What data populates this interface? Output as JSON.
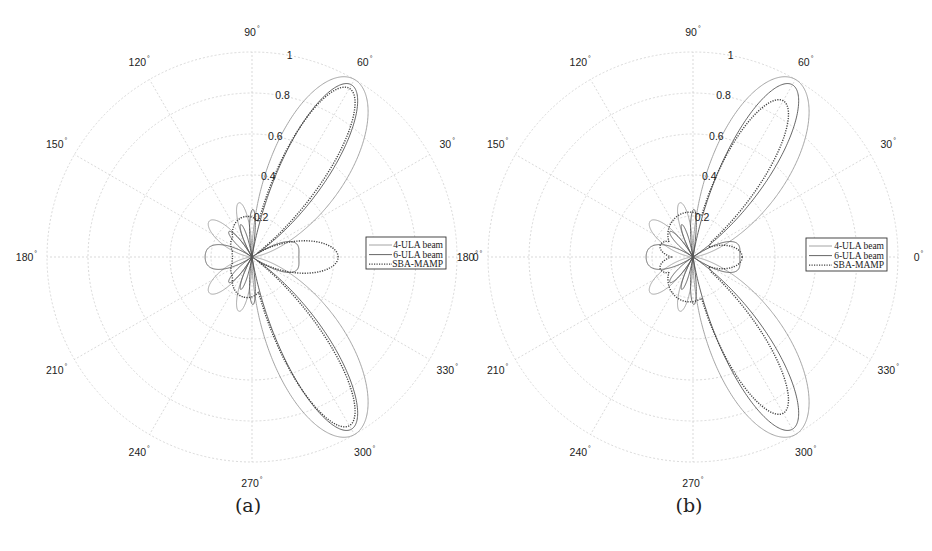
{
  "figure": {
    "panels": [
      {
        "id": "a",
        "caption": "(a)",
        "center": [
          252,
          257
        ],
        "radius": 205,
        "legend_box": [
          366,
          237,
          80,
          32
        ]
      },
      {
        "id": "b",
        "caption": "(b)",
        "center": [
          693,
          257
        ],
        "radius": 205,
        "legend_box": [
          806,
          238,
          81,
          33
        ]
      }
    ],
    "angle_labels": [
      "0",
      "30",
      "60",
      "90",
      "120",
      "150",
      "180",
      "210",
      "240",
      "270",
      "300",
      "330"
    ],
    "radial_labels": [
      "0.2",
      "0.4",
      "0.6",
      "0.8",
      "1"
    ],
    "degree_symbol": "°",
    "colors": {
      "grid": "#c8c8c8",
      "ula4": "#9a9a9a",
      "ula6": "#555555",
      "sba": "#444444",
      "text": "#222222",
      "legend_border": "#333333"
    }
  },
  "chart_data": [
    {
      "type": "polar",
      "title": "(a)",
      "rlim": [
        0,
        1
      ],
      "radial_ticks": [
        0.2,
        0.4,
        0.6,
        0.8,
        1
      ],
      "radial_tick_angle_deg": 80,
      "angle_ticks_deg": [
        0,
        30,
        60,
        90,
        120,
        150,
        180,
        210,
        240,
        270,
        300,
        330
      ],
      "grid": true,
      "legend": {
        "position": "right-of-center",
        "entries": [
          "4-ULA beam",
          "6-ULA beam",
          "SBA-MAMP"
        ]
      },
      "series": [
        {
          "name": "4-ULA beam",
          "style": "solid-light",
          "model": "ula",
          "N": 4,
          "steer_deg": 60,
          "scale": 1.0,
          "peaks": [
            {
              "angle": 60,
              "r": 1.0
            },
            {
              "angle": 300,
              "r": 1.0
            },
            {
              "angle": 104,
              "r": 0.27
            },
            {
              "angle": 139,
              "r": 0.27
            },
            {
              "angle": 180,
              "r": 0.22
            },
            {
              "angle": 0,
              "r": 0.21
            }
          ]
        },
        {
          "name": "6-ULA beam",
          "style": "solid-dark",
          "model": "ula",
          "N": 6,
          "steer_deg": 60,
          "scale": 0.97,
          "peaks": [
            {
              "angle": 60,
              "r": 0.97
            },
            {
              "angle": 300,
              "r": 0.97
            },
            {
              "angle": 95,
              "r": 0.21
            },
            {
              "angle": 115,
              "r": 0.17
            },
            {
              "angle": 135,
              "r": 0.15
            }
          ]
        },
        {
          "name": "SBA-MAMP",
          "style": "dotted",
          "model": "lobes",
          "lobes": [
            [
              60,
              0.95,
              9
            ],
            [
              300,
              0.95,
              9
            ],
            [
              0,
              0.42,
              14
            ],
            [
              100,
              0.2,
              30
            ],
            [
              260,
              0.2,
              30
            ],
            [
              120,
              0.14,
              40
            ],
            [
              240,
              0.14,
              40
            ],
            [
              160,
              0.1,
              40
            ],
            [
              200,
              0.1,
              40
            ]
          ],
          "peaks": [
            {
              "angle": 60,
              "r": 0.95
            },
            {
              "angle": 300,
              "r": 0.95
            },
            {
              "angle": 0,
              "r": 0.42
            }
          ]
        }
      ]
    },
    {
      "type": "polar",
      "title": "(b)",
      "rlim": [
        0,
        1
      ],
      "radial_ticks": [
        0.2,
        0.4,
        0.6,
        0.8,
        1
      ],
      "radial_tick_angle_deg": 80,
      "angle_ticks_deg": [
        0,
        30,
        60,
        90,
        120,
        150,
        180,
        210,
        240,
        270,
        300,
        330
      ],
      "grid": true,
      "legend": {
        "position": "right-of-center",
        "entries": [
          "4-ULA beam",
          "6-ULA beam",
          "SBA-MAMP"
        ]
      },
      "series": [
        {
          "name": "4-ULA beam",
          "style": "solid-light",
          "model": "ula",
          "N": 4,
          "steer_deg": 60,
          "scale": 1.0,
          "peaks": [
            {
              "angle": 60,
              "r": 1.0
            },
            {
              "angle": 300,
              "r": 1.0
            },
            {
              "angle": 104,
              "r": 0.27
            },
            {
              "angle": 139,
              "r": 0.27
            },
            {
              "angle": 180,
              "r": 0.24
            },
            {
              "angle": 0,
              "r": 0.2
            }
          ]
        },
        {
          "name": "6-ULA beam",
          "style": "solid-dark",
          "model": "ula",
          "N": 6,
          "steer_deg": 60,
          "scale": 0.97,
          "peaks": [
            {
              "angle": 60,
              "r": 0.97
            },
            {
              "angle": 300,
              "r": 0.97
            },
            {
              "angle": 95,
              "r": 0.21
            },
            {
              "angle": 115,
              "r": 0.17
            }
          ]
        },
        {
          "name": "SBA-MAMP",
          "style": "dotted",
          "model": "lobes",
          "lobes": [
            [
              60,
              0.88,
              9
            ],
            [
              300,
              0.88,
              9
            ],
            [
              0,
              0.24,
              18
            ],
            [
              98,
              0.22,
              40
            ],
            [
              262,
              0.22,
              40
            ],
            [
              160,
              0.17,
              16
            ],
            [
              200,
              0.17,
              16
            ],
            [
              130,
              0.14,
              40
            ],
            [
              230,
              0.14,
              40
            ]
          ],
          "peaks": [
            {
              "angle": 60,
              "r": 0.88
            },
            {
              "angle": 300,
              "r": 0.88
            },
            {
              "angle": 0,
              "r": 0.24
            }
          ]
        }
      ]
    }
  ]
}
